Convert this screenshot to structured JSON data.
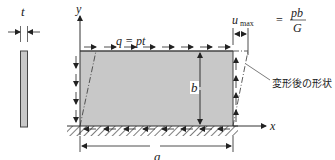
{
  "diagram": {
    "thickness_label": "t",
    "y_axis_label": "y",
    "x_axis_label": "x",
    "load_label": "q = pt",
    "height_label": "b",
    "width_label": "a",
    "umax": {
      "lhs": "u",
      "lhs_sub": "max",
      "equals": "=",
      "numerator": "pb",
      "denominator": "G"
    },
    "deformed_shape_label": "変形後の形状",
    "colors": {
      "plate_fill": "#c8c8c8",
      "stroke": "#333333",
      "background": "#ffffff"
    }
  }
}
